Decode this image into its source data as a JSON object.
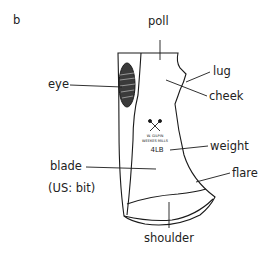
{
  "figure": {
    "panel_label": "b",
    "labels": {
      "poll": "poll",
      "lug": "lug",
      "cheek": "cheek",
      "eye": "eye",
      "weight": "weight",
      "blade": "blade",
      "blade_us": "(US: bit)",
      "flare": "flare",
      "shoulder": "shoulder"
    },
    "stamp": {
      "maker_line1": "W. GILPIN",
      "maker_line2": "WEEKES MILLS",
      "weight_mark": "4LB"
    },
    "colors": {
      "line": "#1a1a1a",
      "text": "#222222",
      "background": "#ffffff"
    }
  }
}
